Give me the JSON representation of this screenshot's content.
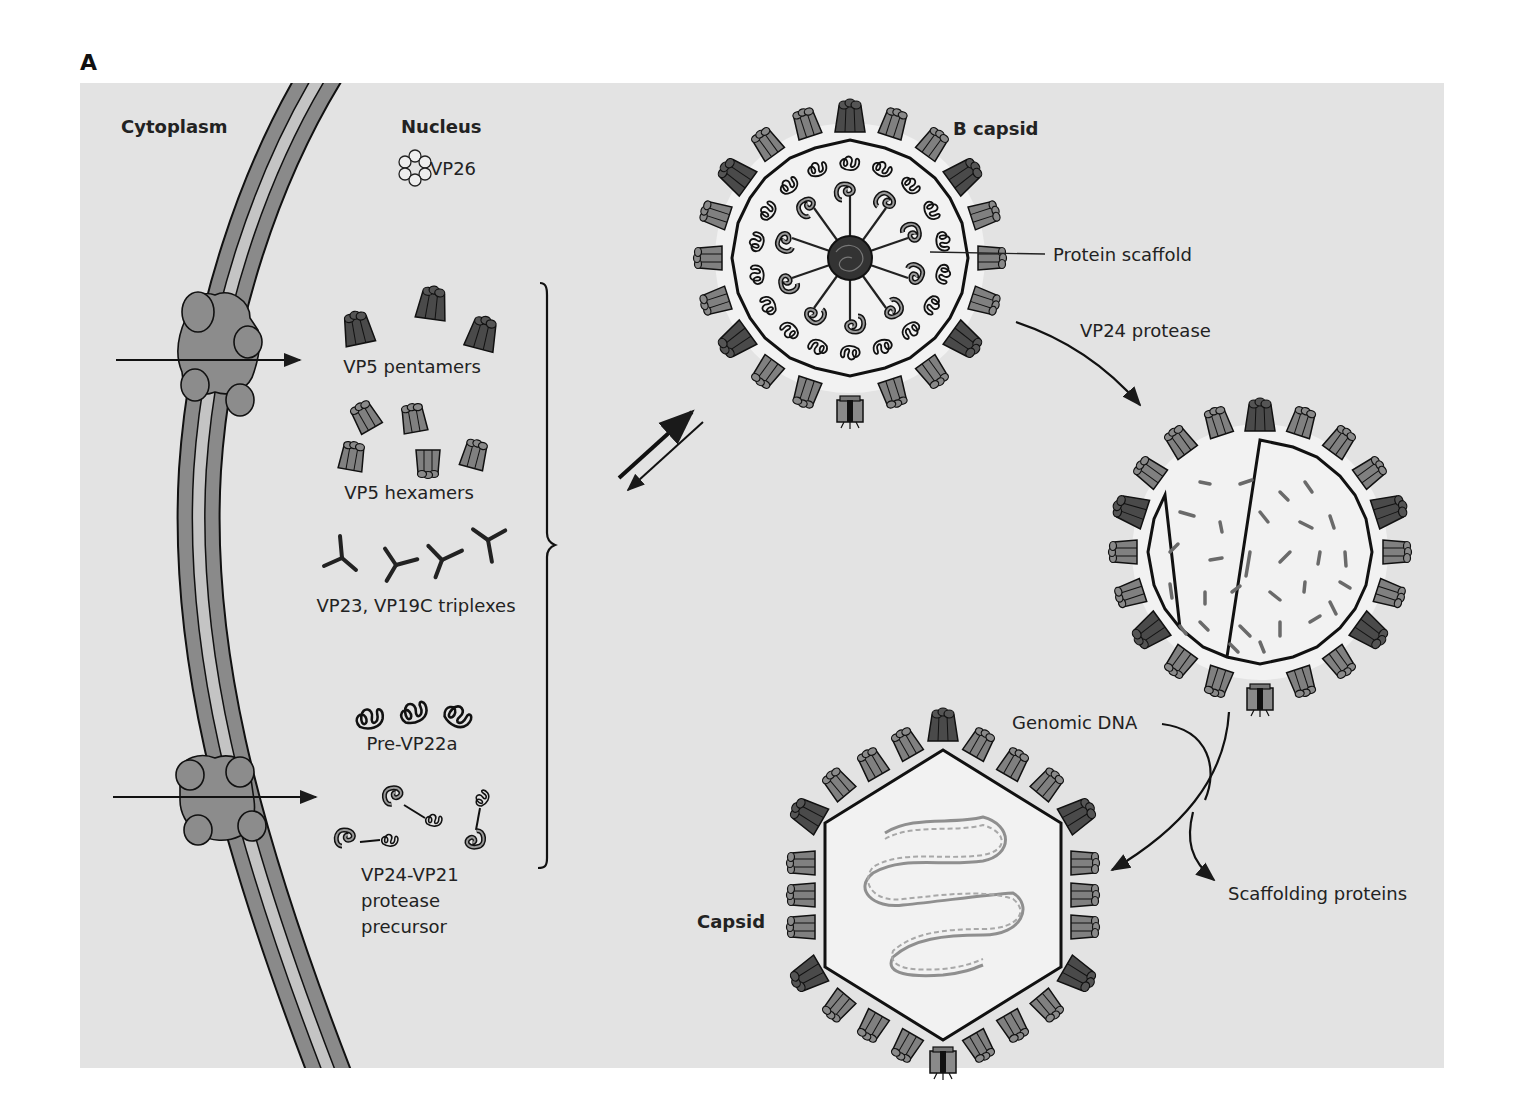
{
  "figure": {
    "panel_letter": "A",
    "background_color": "#e3e3e3",
    "colors": {
      "membrane_outer": "#8a8a8a",
      "membrane_inner": "#c4c4c4",
      "pore": "#8c8c8c",
      "pentamer": "#4a4a4a",
      "hexamer": "#7e7e7e",
      "dna": "#8f8f8f",
      "line": "#1a1a1a"
    }
  },
  "compartments": {
    "cytoplasm": "Cytoplasm",
    "nucleus": "Nucleus"
  },
  "components": {
    "vp26": "VP26",
    "vp5_pentamers": "VP5 pentamers",
    "vp5_hexamers": "VP5 hexamers",
    "triplexes": "VP23, VP19C triplexes",
    "pre_vp22a": "Pre-VP22a",
    "protease_precursor_line1": "VP24-VP21",
    "protease_precursor_line2": "protease",
    "protease_precursor_line3": "precursor"
  },
  "stages": {
    "b_capsid": "B capsid",
    "protein_scaffold": "Protein scaffold",
    "vp24_protease": "VP24 protease",
    "genomic_dna": "Genomic DNA",
    "scaffolding_proteins": "Scaffolding proteins",
    "capsid": "Capsid"
  }
}
